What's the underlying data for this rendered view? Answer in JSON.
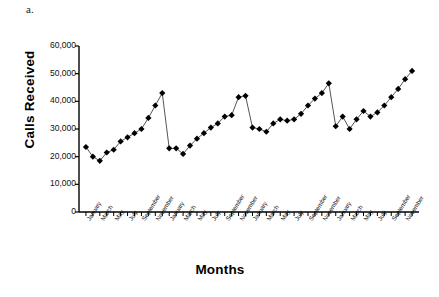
{
  "panel_label": "a.",
  "chart_data": {
    "type": "line",
    "title": "",
    "xlabel": "Months",
    "ylabel": "Calls Received",
    "ylim": [
      0,
      60000
    ],
    "ytick_values": [
      0,
      10000,
      20000,
      30000,
      40000,
      50000,
      60000
    ],
    "ytick_labels": [
      "0",
      "10,000",
      "20,000",
      "30,000",
      "40,000",
      "50,000",
      "60,000"
    ],
    "grid": false,
    "legend": "none",
    "marker": "diamond",
    "marker_color": "#000000",
    "line_color": "#555555",
    "categories": [
      "January",
      "February",
      "March",
      "April",
      "May",
      "June",
      "July",
      "August",
      "September",
      "October",
      "November",
      "December",
      "January",
      "February",
      "March",
      "April",
      "May",
      "June",
      "July",
      "August",
      "September",
      "October",
      "November",
      "December",
      "January",
      "February",
      "March",
      "April",
      "May",
      "June",
      "July",
      "August",
      "September",
      "October",
      "November",
      "December",
      "January",
      "February",
      "March",
      "April",
      "May",
      "June",
      "July",
      "August",
      "September",
      "October",
      "November",
      "December"
    ],
    "xtick_labeled": [
      "January",
      "March",
      "May",
      "July",
      "September",
      "November",
      "January",
      "March",
      "May",
      "July",
      "September",
      "November",
      "January",
      "March",
      "May",
      "July",
      "September",
      "November",
      "January",
      "March",
      "May",
      "July",
      "September",
      "November"
    ],
    "values": [
      23500,
      20000,
      18500,
      21500,
      22500,
      25500,
      27000,
      28500,
      30000,
      34000,
      38500,
      43000,
      23000,
      23000,
      21000,
      24000,
      26500,
      28500,
      30500,
      32000,
      34500,
      35000,
      41500,
      42000,
      30500,
      30000,
      29000,
      32000,
      33500,
      33000,
      33500,
      35500,
      38500,
      41000,
      43000,
      46500,
      31000,
      34500,
      30000,
      33500,
      36500,
      34500,
      36000,
      38500,
      41500,
      44500,
      48000,
      51000
    ],
    "series": [
      {
        "name": "Calls Received",
        "values": [
          23500,
          20000,
          18500,
          21500,
          22500,
          25500,
          27000,
          28500,
          30000,
          34000,
          38500,
          43000,
          23000,
          23000,
          21000,
          24000,
          26500,
          28500,
          30500,
          32000,
          34500,
          35000,
          41500,
          42000,
          30500,
          30000,
          29000,
          32000,
          33500,
          33000,
          33500,
          35500,
          38500,
          41000,
          43000,
          46500,
          31000,
          34500,
          30000,
          33500,
          36500,
          34500,
          36000,
          38500,
          41500,
          44500,
          48000,
          51000
        ]
      }
    ]
  }
}
